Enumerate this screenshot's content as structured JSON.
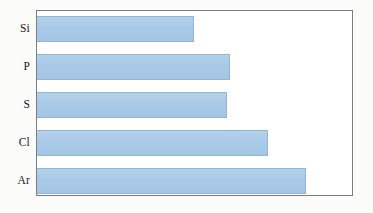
{
  "chart_data": {
    "type": "bar",
    "orientation": "horizontal",
    "title": "",
    "xlabel": "",
    "ylabel": "",
    "categories": [
      "Si",
      "P",
      "S",
      "Cl",
      "Ar"
    ],
    "values": [
      157,
      193,
      190,
      231,
      269
    ],
    "value_unit": "relative bar length (px)",
    "xlim": [
      0,
      317
    ],
    "grid": false,
    "legend": null,
    "axis_ticks": {
      "x": [],
      "y": [
        "Si",
        "P",
        "S",
        "Cl",
        "Ar"
      ]
    },
    "annotations": [],
    "bars": [
      {
        "label": "Si",
        "value": 157
      },
      {
        "label": "P",
        "value": 193
      },
      {
        "label": "S",
        "value": 190
      },
      {
        "label": "Cl",
        "value": 231
      },
      {
        "label": "Ar",
        "value": 269
      }
    ]
  },
  "style": {
    "bar_fill": "#aacbe8",
    "bar_edge": "#93b4d2",
    "frame_border": "#7d7d7d",
    "plot_background": "#ffffff",
    "page_background": "#fbfbfa",
    "label_color": "#1a1a1a"
  }
}
